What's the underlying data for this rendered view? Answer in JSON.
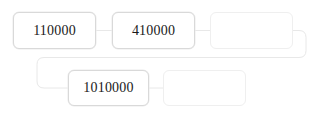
{
  "diagram": {
    "type": "flow-sequence",
    "background_color": "#ffffff",
    "node_border_color": "#d9d9d9",
    "node_empty_border_color": "#efefef",
    "connector_color": "#e8e8e8",
    "label_color": "#1a1a1a",
    "nodes": [
      {
        "id": "node-1",
        "label": "110000",
        "empty": false,
        "x": 13,
        "y": 12,
        "width": 83,
        "height": 37
      },
      {
        "id": "node-2",
        "label": "410000",
        "empty": false,
        "x": 112,
        "y": 12,
        "width": 83,
        "height": 37
      },
      {
        "id": "node-3",
        "label": "",
        "empty": true,
        "x": 210,
        "y": 12,
        "width": 83,
        "height": 37
      },
      {
        "id": "node-4",
        "label": "1010000",
        "empty": false,
        "x": 68,
        "y": 70,
        "width": 81,
        "height": 36
      },
      {
        "id": "node-5",
        "label": "",
        "empty": true,
        "x": 163,
        "y": 70,
        "width": 83,
        "height": 36
      }
    ],
    "connectors": [
      {
        "id": "connector-1-2",
        "from": "node-1",
        "to": "node-2",
        "kind": "straight"
      },
      {
        "id": "connector-2-3",
        "from": "node-2",
        "to": "node-3",
        "kind": "straight"
      },
      {
        "id": "connector-3-4",
        "from": "node-3",
        "to": "node-4",
        "kind": "wrap"
      },
      {
        "id": "connector-4-5",
        "from": "node-4",
        "to": "node-5",
        "kind": "straight"
      }
    ]
  }
}
